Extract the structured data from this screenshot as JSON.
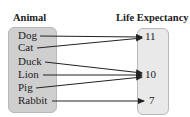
{
  "headers": {
    "domain": "Animal",
    "range": "Life Expectancy"
  },
  "domain_items": [
    {
      "label": "Dog",
      "y": 35
    },
    {
      "label": "Cat",
      "y": 47
    },
    {
      "label": "Duck",
      "y": 61
    },
    {
      "label": "Lion",
      "y": 74
    },
    {
      "label": "Pig",
      "y": 87
    },
    {
      "label": "Rabbit",
      "y": 100
    }
  ],
  "range_items": [
    {
      "label": "11",
      "y": 36
    },
    {
      "label": "10",
      "y": 74
    },
    {
      "label": "7",
      "y": 100
    }
  ],
  "mapping": [
    {
      "from": "Dog",
      "to": "11"
    },
    {
      "from": "Cat",
      "to": "11"
    },
    {
      "from": "Duck",
      "to": "10"
    },
    {
      "from": "Lion",
      "to": "10"
    },
    {
      "from": "Pig",
      "to": "10"
    },
    {
      "from": "Rabbit",
      "to": "7"
    }
  ],
  "colors": {
    "domain_box": "#cfcfcf",
    "range_box": "#e9e9e9",
    "arrow": "#222222"
  }
}
